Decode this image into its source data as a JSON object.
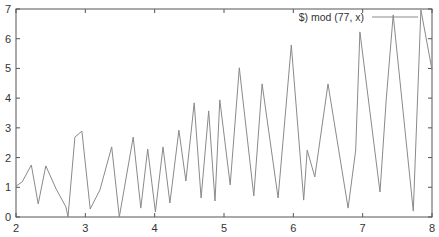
{
  "chart_data": {
    "type": "line",
    "title": "",
    "xlabel": "",
    "ylabel": "",
    "xlim": [
      2,
      8
    ],
    "ylim": [
      0,
      7
    ],
    "grid": false,
    "legend_position": "top-right",
    "x_ticks": [
      "2",
      "3",
      "4",
      "5",
      "6",
      "7",
      "8"
    ],
    "y_ticks": [
      "0",
      "1",
      "2",
      "3",
      "4",
      "5",
      "6",
      "7"
    ],
    "series": [
      {
        "name": "$) mod (77, x)",
        "color": "#8a8a8a",
        "x": [
          2.0,
          2.09,
          2.22,
          2.32,
          2.43,
          2.58,
          2.72,
          2.75,
          2.85,
          2.95,
          3.07,
          3.21,
          3.38,
          3.49,
          3.69,
          3.8,
          3.9,
          4.01,
          4.12,
          4.22,
          4.35,
          4.45,
          4.57,
          4.67,
          4.78,
          4.87,
          4.94,
          5.09,
          5.22,
          5.43,
          5.55,
          5.78,
          5.97,
          6.15,
          6.2,
          6.31,
          6.5,
          6.79,
          6.9,
          6.96,
          7.25,
          7.34,
          7.44,
          7.73,
          7.84,
          8.0
        ],
        "values": [
          1.04,
          1.18,
          1.75,
          0.44,
          1.72,
          0.94,
          0.34,
          0.0,
          2.69,
          2.89,
          0.27,
          0.91,
          2.36,
          0.0,
          2.69,
          0.3,
          2.29,
          0.17,
          2.36,
          0.47,
          2.92,
          1.21,
          3.84,
          0.64,
          3.57,
          0.54,
          3.94,
          1.08,
          5.02,
          0.71,
          4.48,
          0.64,
          5.79,
          0.57,
          2.25,
          1.35,
          4.48,
          0.3,
          2.25,
          6.23,
          0.84,
          3.94,
          6.8,
          0.2,
          6.97,
          4.95
        ]
      }
    ]
  },
  "plot_box": {
    "left": 16,
    "right": 432,
    "top": 9,
    "bottom": 217
  },
  "colors": {
    "axis": "#555555",
    "line": "#8a8a8a",
    "text": "#333333",
    "background": "#ffffff"
  }
}
